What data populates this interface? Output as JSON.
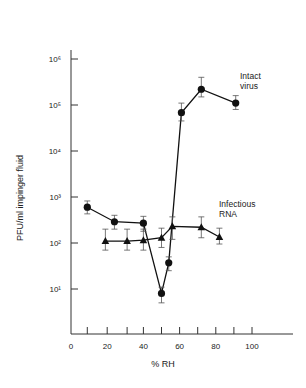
{
  "chart_data": {
    "type": "line",
    "title": "",
    "xlabel": "% RH",
    "ylabel": "PFU/ml impinger fluid",
    "xlim": [
      0,
      120
    ],
    "ylim": [
      1,
      1000000
    ],
    "yscale": "log",
    "grid": false,
    "x_ticks": [
      0,
      20,
      40,
      60,
      80,
      100
    ],
    "x_tick_labels": [
      "0",
      "20",
      "40",
      "60",
      "80",
      "100"
    ],
    "x_minor_ticks": [
      9,
      20,
      31,
      40,
      50,
      60,
      70,
      80,
      90,
      100
    ],
    "y_ticks": [
      10,
      100,
      1000,
      10000,
      100000,
      1000000
    ],
    "y_tick_labels": [
      "10¹",
      "10²",
      "10³",
      "10⁴",
      "10⁵",
      "10⁶"
    ],
    "series": [
      {
        "name": "Intact virus",
        "marker": "circle",
        "x": [
          9,
          24,
          40,
          50,
          54,
          61,
          72,
          91
        ],
        "values": [
          600,
          290,
          270,
          8,
          37,
          68000,
          220000,
          110000
        ],
        "err_low": [
          430,
          200,
          180,
          5,
          25,
          45000,
          150000,
          80000
        ],
        "err_high": [
          820,
          400,
          380,
          11,
          50,
          110000,
          400000,
          160000
        ]
      },
      {
        "name": "Infectious RNA",
        "marker": "triangle",
        "x": [
          19,
          31,
          40,
          50,
          56,
          72,
          82
        ],
        "values": [
          110,
          110,
          115,
          130,
          230,
          220,
          135
        ],
        "err_low": [
          70,
          70,
          70,
          80,
          120,
          130,
          95
        ],
        "err_high": [
          200,
          200,
          200,
          210,
          370,
          370,
          210
        ]
      }
    ],
    "annotations": [
      {
        "text": "Intact\nvirus",
        "x": 97,
        "y": 300000
      },
      {
        "text": "Infectious\nRNA",
        "x": 97,
        "y": 700
      }
    ],
    "legend_position": "inline"
  },
  "labels": {
    "xlabel": "% RH",
    "ylabel": "PFU/ml impinger fluid",
    "intact_1": "Intact",
    "intact_2": "virus",
    "rna_1": "Infectious",
    "rna_2": "RNA"
  }
}
